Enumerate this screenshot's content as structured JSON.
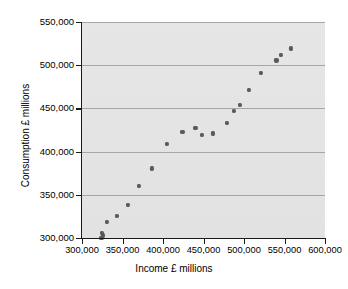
{
  "chart_data": {
    "type": "scatter",
    "title": "",
    "xlabel": "Income £ millions",
    "ylabel": "Consumption £ millions",
    "xlim": [
      300000,
      600000
    ],
    "ylim": [
      300000,
      550000
    ],
    "xticks": [
      300000,
      350000,
      400000,
      450000,
      500000,
      550000,
      600000
    ],
    "yticks": [
      300000,
      350000,
      400000,
      450000,
      500000,
      550000
    ],
    "xticklabels": [
      "300,000",
      "350,000",
      "400,000",
      "450,000",
      "500,000",
      "550,000",
      "600,000"
    ],
    "yticklabels": [
      "300,000",
      "350,000",
      "400,000",
      "450,000",
      "500,000",
      "550,000"
    ],
    "grid": "horizontal",
    "legend": "none",
    "marker_color": "#5b5b5b",
    "plot_background": "#e4e4e4",
    "points": [
      {
        "x": 324000,
        "y": 300500
      },
      {
        "x": 326000,
        "y": 303000
      },
      {
        "x": 325000,
        "y": 305500
      },
      {
        "x": 331000,
        "y": 319000
      },
      {
        "x": 343000,
        "y": 326000
      },
      {
        "x": 357000,
        "y": 338000
      },
      {
        "x": 370000,
        "y": 360500
      },
      {
        "x": 386000,
        "y": 380500
      },
      {
        "x": 405000,
        "y": 409000
      },
      {
        "x": 424000,
        "y": 423000
      },
      {
        "x": 440000,
        "y": 427000
      },
      {
        "x": 448000,
        "y": 419000
      },
      {
        "x": 462000,
        "y": 421000
      },
      {
        "x": 479000,
        "y": 433000
      },
      {
        "x": 488000,
        "y": 447000
      },
      {
        "x": 495000,
        "y": 454000
      },
      {
        "x": 506000,
        "y": 471000
      },
      {
        "x": 521000,
        "y": 491000
      },
      {
        "x": 540000,
        "y": 505500
      },
      {
        "x": 546000,
        "y": 512000
      },
      {
        "x": 558000,
        "y": 519500
      }
    ]
  }
}
